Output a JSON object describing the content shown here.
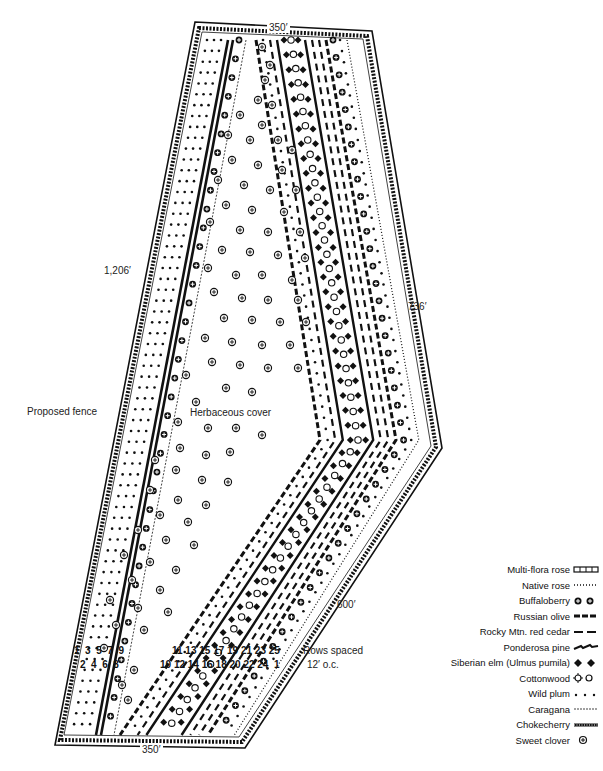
{
  "diagram": {
    "type": "windbreak planting plan",
    "dimensions": {
      "top": "350′",
      "bottom": "350′",
      "left": "1,206′",
      "right_upper": "736′",
      "right_lower": "600′"
    },
    "labels": {
      "fence": "Proposed fence",
      "center": "Herbaceous cover",
      "spacing_line1": "Rows spaced",
      "spacing_line2": "12′ o.c."
    },
    "row_numbers": {
      "left_top": "1  3  5  7  9",
      "left_bottom": "2  4  6  8",
      "right_top": "11 13 15 17 19 21 23 25",
      "right_bottom": "10 12 14 16 18 20 22 24  1"
    },
    "legend": [
      {
        "label": "Multi-flora rose",
        "symbol": "multiflora-rose-icon"
      },
      {
        "label": "Native rose",
        "symbol": "native-rose-icon"
      },
      {
        "label": "Buffaloberry",
        "symbol": "buffaloberry-icon"
      },
      {
        "label": "Russian olive",
        "symbol": "russian-olive-icon"
      },
      {
        "label": "Rocky Mtn. red cedar",
        "symbol": "red-cedar-icon"
      },
      {
        "label": "Ponderosa pine",
        "symbol": "ponderosa-pine-icon"
      },
      {
        "label": "Siberian elm (Ulmus pumila)",
        "symbol": "siberian-elm-icon"
      },
      {
        "label": "Cottonwood",
        "symbol": "cottonwood-icon"
      },
      {
        "label": "Wild plum",
        "symbol": "wild-plum-icon"
      },
      {
        "label": "Caragana",
        "symbol": "caragana-icon"
      },
      {
        "label": "Chokecherry",
        "symbol": "chokecherry-icon"
      },
      {
        "label": "Sweet clover",
        "symbol": "sweet-clover-icon"
      }
    ],
    "colors": {
      "ink": "#111111",
      "paper": "#ffffff"
    }
  }
}
